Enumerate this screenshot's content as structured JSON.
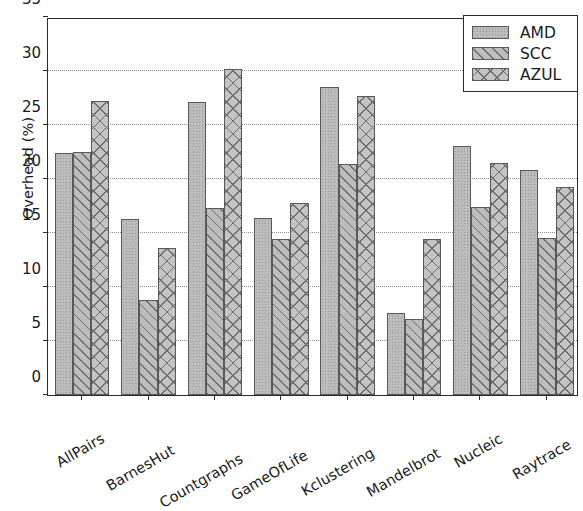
{
  "chart_data": {
    "type": "bar",
    "title": "",
    "xlabel": "",
    "ylabel": "Overhead (%)",
    "ylim": [
      0,
      35
    ],
    "yticks": [
      0,
      5,
      10,
      15,
      20,
      25,
      30,
      35
    ],
    "ytick_labels": [
      "0",
      "5",
      "10",
      "15",
      "20",
      "25",
      "30",
      "35"
    ],
    "grid": "horizontal-dotted",
    "legend_position": "upper right",
    "categories": [
      "AllPairs",
      "BarnesHut",
      "Countgraphs",
      "GameOfLife",
      "Kclustering",
      "Mandelbrot",
      "Nucleic",
      "Raytrace"
    ],
    "series": [
      {
        "name": "AMD",
        "pattern": "stipple",
        "color": "#bdbdbd",
        "values": [
          22.4,
          16.3,
          27.1,
          16.4,
          28.5,
          7.6,
          23.1,
          20.8
        ]
      },
      {
        "name": "SCC",
        "pattern": "diagonal-hatch",
        "color": "#bdbdbd",
        "values": [
          22.5,
          8.8,
          17.3,
          14.4,
          21.4,
          7.0,
          17.4,
          14.5
        ]
      },
      {
        "name": "AZUL",
        "pattern": "cross-hatch",
        "color": "#c4c4c4",
        "values": [
          27.2,
          13.6,
          30.2,
          17.8,
          27.7,
          14.4,
          21.5,
          19.3
        ]
      }
    ]
  },
  "legend": {
    "items": [
      {
        "label": "AMD"
      },
      {
        "label": "SCC"
      },
      {
        "label": "AZUL"
      }
    ]
  }
}
